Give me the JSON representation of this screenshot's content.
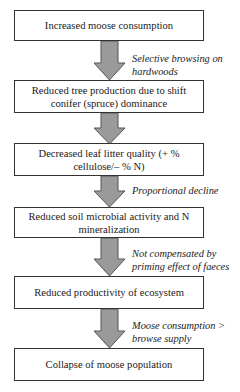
{
  "diagram": {
    "type": "vertical-flowchart",
    "arrow_fill": "#9a9a9a",
    "arrow_stroke": "#555555",
    "box_border": "#333333",
    "nodes": [
      {
        "id": "n1",
        "text": "Increased moose consumption"
      },
      {
        "id": "n2",
        "text": "Reduced tree production due to shift conifer (spruce) dominance"
      },
      {
        "id": "n3",
        "text": "Decreased leaf litter quality (+ % cellulose/– % N)"
      },
      {
        "id": "n4",
        "text": "Reduced soil microbial activity and N mineralization"
      },
      {
        "id": "n5",
        "text": "Reduced productivity of ecosystem"
      },
      {
        "id": "n6",
        "text": "Collapse of moose population"
      }
    ],
    "edges": [
      {
        "from": "n1",
        "to": "n2",
        "label": "Selective browsing on hardwoods"
      },
      {
        "from": "n2",
        "to": "n3",
        "label": ""
      },
      {
        "from": "n3",
        "to": "n4",
        "label": "Proportional decline"
      },
      {
        "from": "n4",
        "to": "n5",
        "label": "Not compensated by priming effect of faeces"
      },
      {
        "from": "n5",
        "to": "n6",
        "label": "Moose consumption > browse supply"
      }
    ]
  }
}
